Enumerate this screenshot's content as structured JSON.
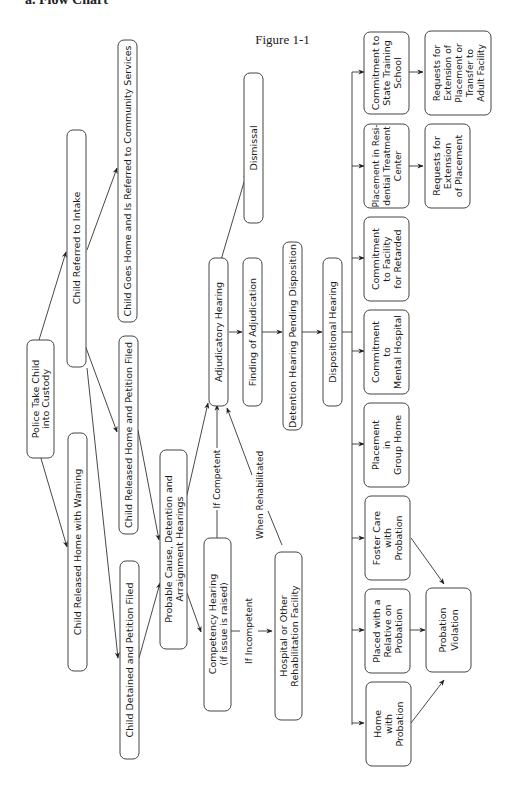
{
  "page": {
    "header_fragment": "a. Flow Chart",
    "figure_title": "Figure 1-1"
  },
  "nodes": {
    "police": [
      "Police Take Child",
      "into Custody"
    ],
    "released_warning": [
      "Child Released Home with Warning"
    ],
    "referred_intake": [
      "Child Referred to Intake"
    ],
    "goes_home": [
      "Child Goes Home and Is Referred to Community Services"
    ],
    "released_petition": [
      "Child Released Home and Petition Filed"
    ],
    "detained_petition": [
      "Child Detained and Petition Filed"
    ],
    "probable_cause": [
      "Probable Cause, Detention and",
      "Arraignment Hearings"
    ],
    "competency": [
      "Competency Hearing",
      "(if issue is raised)"
    ],
    "hospital": [
      "Hospital or Other",
      "Rehabilitation Facility"
    ],
    "adjudicatory": [
      "Adjudicatory Hearing"
    ],
    "dismissal": [
      "Dismissal"
    ],
    "finding": [
      "Finding of Adjudication"
    ],
    "detention_pending": [
      "Detention Hearing Pending Disposition"
    ],
    "dispositional": [
      "Dispositional Hearing"
    ],
    "home_probation": [
      "Home",
      "with",
      "Probation"
    ],
    "relative_probation": [
      "Placed with a",
      "Relative on",
      "Probation"
    ],
    "foster_probation": [
      "Foster Care",
      "with",
      "Probation"
    ],
    "group_home": [
      "Placement",
      "in",
      "Group Home"
    ],
    "mental_hospital": [
      "Commitment",
      "to",
      "Mental Hospital"
    ],
    "facility_retarded": [
      "Commitment",
      "to Facility",
      "for Retarded"
    ],
    "residential": [
      "Placement in Resi-",
      "dential Treatment",
      "Center"
    ],
    "state_school": [
      "Commitment to",
      "State Training",
      "School"
    ],
    "probation_violation": [
      "Probation",
      "Violation"
    ],
    "extension_placement": [
      "Requests for",
      "Extension",
      "of Placement"
    ],
    "extension_transfer": [
      "Requests for",
      "Extension of",
      "Placement or",
      "Transfer to",
      "Adult Facility"
    ]
  },
  "edge_labels": {
    "if_competent": "If Competent",
    "if_incompetent": "If Incompetent",
    "when_rehabilitated": "When Rehabilitated"
  },
  "colors": {
    "stroke": "#444444",
    "text": "#1a1a1a",
    "background": "#ffffff"
  }
}
